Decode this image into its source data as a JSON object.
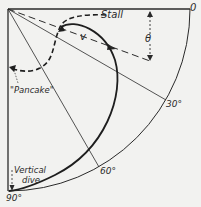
{
  "diagram": {
    "labels": {
      "stall": "Stall",
      "velocity": "v",
      "theta": "θ",
      "pancake": "\"Pancake\"",
      "vertical_dive_line1": "Vertical",
      "vertical_dive_line2": "dive",
      "angle_0": "0",
      "angle_30": "30°",
      "angle_60": "60°",
      "angle_90": "90°"
    },
    "colors": {
      "background": "#f2f2f0",
      "ink": "#2a2a2a"
    }
  }
}
